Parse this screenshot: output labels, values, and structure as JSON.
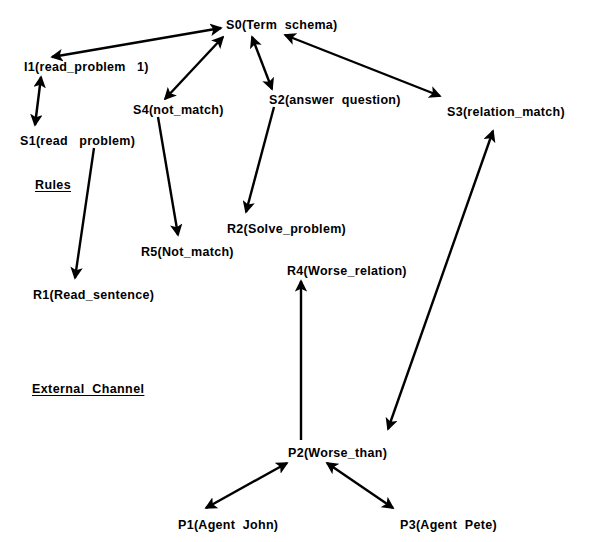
{
  "diagram": {
    "title_top_clipped": "Internal Channel",
    "background_color": "#ffffff",
    "stroke_color": "#000000",
    "width": 597,
    "height": 542,
    "section_labels": [
      {
        "id": "top-heading",
        "text": "Internal  Channel",
        "x": 27,
        "y": -6,
        "clipped": true
      },
      {
        "id": "rules",
        "text": "Rules",
        "x": 35,
        "y": 178
      },
      {
        "id": "external-channel",
        "text": "External  Channel",
        "x": 32,
        "y": 382
      }
    ],
    "nodes": [
      {
        "id": "S0",
        "label": "S0(Term  schema)",
        "x": 226,
        "y": 18
      },
      {
        "id": "I1",
        "label": "I1(read_problem   1)",
        "x": 24,
        "y": 60
      },
      {
        "id": "S4",
        "label": "S4(not_match)",
        "x": 133,
        "y": 103
      },
      {
        "id": "S2",
        "label": "S2(answer  question)",
        "x": 269,
        "y": 93
      },
      {
        "id": "S3",
        "label": "S3(relation_match)",
        "x": 447,
        "y": 105
      },
      {
        "id": "S1",
        "label": "S1(read   problem)",
        "x": 20,
        "y": 134
      },
      {
        "id": "R5",
        "label": "R5(Not_match)",
        "x": 141,
        "y": 245
      },
      {
        "id": "R2",
        "label": "R2(Solve_problem)",
        "x": 227,
        "y": 222
      },
      {
        "id": "R1",
        "label": "R1(Read_sentence)",
        "x": 33,
        "y": 288
      },
      {
        "id": "R4",
        "label": "R4(Worse_relation)",
        "x": 287,
        "y": 264
      },
      {
        "id": "P2",
        "label": "P2(Worse_than)",
        "x": 288,
        "y": 446
      },
      {
        "id": "P1",
        "label": "P1(Agent  John)",
        "x": 178,
        "y": 518
      },
      {
        "id": "P3",
        "label": "P3(Agent  Pete)",
        "x": 400,
        "y": 518
      }
    ],
    "edges": [
      {
        "id": "I1-S0",
        "from": "I1",
        "to": "S0",
        "type": "double",
        "x1": 52,
        "y1": 57,
        "x2": 221,
        "y2": 28
      },
      {
        "id": "I1-S1",
        "from": "I1",
        "to": "S1",
        "type": "double",
        "x1": 41,
        "y1": 77,
        "x2": 35,
        "y2": 125
      },
      {
        "id": "S4-S0",
        "from": "S4",
        "to": "S0",
        "type": "double",
        "x1": 165,
        "y1": 99,
        "x2": 223,
        "y2": 37
      },
      {
        "id": "S0-S2",
        "from": "S0",
        "to": "S2",
        "type": "double",
        "x1": 252,
        "y1": 37,
        "x2": 272,
        "y2": 89
      },
      {
        "id": "S0-S3",
        "from": "S0",
        "to": "S3",
        "type": "double",
        "x1": 285,
        "y1": 35,
        "x2": 440,
        "y2": 96
      },
      {
        "id": "S4-R5",
        "from": "S4",
        "to": "R5",
        "type": "single",
        "x1": 158,
        "y1": 117,
        "x2": 178,
        "y2": 235
      },
      {
        "id": "S2-R2",
        "from": "S2",
        "to": "R2",
        "type": "single",
        "x1": 274,
        "y1": 107,
        "x2": 246,
        "y2": 212
      },
      {
        "id": "S1-R1",
        "from": "S1",
        "to": "R1",
        "type": "single",
        "x1": 94,
        "y1": 148,
        "x2": 75,
        "y2": 278
      },
      {
        "id": "P2-R4",
        "from": "P2",
        "to": "R4",
        "type": "single",
        "x1": 301,
        "y1": 440,
        "x2": 301,
        "y2": 281
      },
      {
        "id": "P2-S3",
        "from": "P2",
        "to": "S3",
        "type": "double",
        "x1": 388,
        "y1": 429,
        "x2": 493,
        "y2": 131
      },
      {
        "id": "P1-P2",
        "from": "P1",
        "to": "P2",
        "type": "double",
        "x1": 206,
        "y1": 508,
        "x2": 287,
        "y2": 463
      },
      {
        "id": "P3-P2",
        "from": "P3",
        "to": "P2",
        "type": "double",
        "x1": 393,
        "y1": 508,
        "x2": 327,
        "y2": 463
      }
    ]
  }
}
